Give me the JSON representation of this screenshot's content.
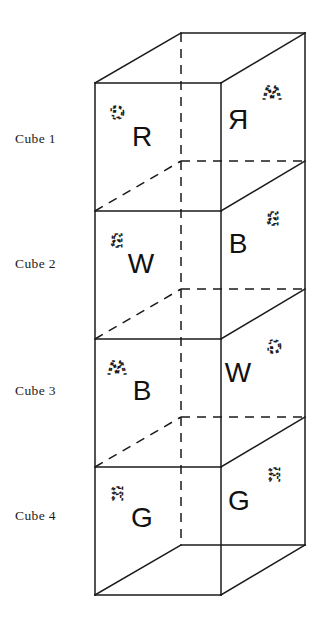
{
  "figure": {
    "projection": "oblique",
    "labels": [
      {
        "id": "cube-1",
        "text": "Cube 1",
        "x": 15,
        "y": 138
      },
      {
        "id": "cube-2",
        "text": "Cube 2",
        "x": 15,
        "y": 263
      },
      {
        "id": "cube-3",
        "text": "Cube 3",
        "x": 15,
        "y": 390
      },
      {
        "id": "cube-4",
        "text": "Cube 4",
        "x": 15,
        "y": 515
      }
    ],
    "geometry": {
      "front_left_x": 95,
      "front_right_x": 221,
      "back_right_x": 305,
      "back_left_x": 181,
      "front_top_y": 83,
      "front_bottom_y": 595,
      "back_top_y": 32,
      "back_bottom_y": 545,
      "depth_dx": 84,
      "depth_dy": -51,
      "cube_height": 128
    },
    "colors": {
      "ink": "#1a1a1a",
      "paper": "#ffffff"
    },
    "cubes": [
      {
        "name": "Cube 1",
        "front_face": {
          "visible_letter": "R",
          "hidden_letter": "G"
        },
        "right_face": {
          "visible_letter": "R",
          "hidden_letter": "W"
        }
      },
      {
        "name": "Cube 2",
        "front_face": {
          "visible_letter": "W",
          "hidden_letter": "B"
        },
        "right_face": {
          "visible_letter": "B",
          "hidden_letter": "B"
        }
      },
      {
        "name": "Cube 3",
        "front_face": {
          "visible_letter": "B",
          "hidden_letter": "W"
        },
        "right_face": {
          "visible_letter": "W",
          "hidden_letter": "G"
        }
      },
      {
        "name": "Cube 4",
        "front_face": {
          "visible_letter": "G",
          "hidden_letter": "R"
        },
        "right_face": {
          "visible_letter": "G",
          "hidden_letter": "R"
        }
      }
    ],
    "glyph_positions": {
      "front_hidden": [
        {
          "x": 117,
          "y": 120
        },
        {
          "x": 117,
          "y": 247
        },
        {
          "x": 117,
          "y": 375
        },
        {
          "x": 117,
          "y": 500
        }
      ],
      "front_visible": [
        {
          "x": 142,
          "y": 146
        },
        {
          "x": 141,
          "y": 273
        },
        {
          "x": 142,
          "y": 400
        },
        {
          "x": 142,
          "y": 527
        }
      ],
      "right_visible": [
        {
          "x": 238,
          "y": 129
        },
        {
          "x": 238,
          "y": 253
        },
        {
          "x": 238,
          "y": 382
        },
        {
          "x": 239,
          "y": 510
        }
      ],
      "right_hidden": [
        {
          "x": 272,
          "y": 100
        },
        {
          "x": 273,
          "y": 225
        },
        {
          "x": 274,
          "y": 353
        },
        {
          "x": 274,
          "y": 481
        }
      ]
    }
  }
}
